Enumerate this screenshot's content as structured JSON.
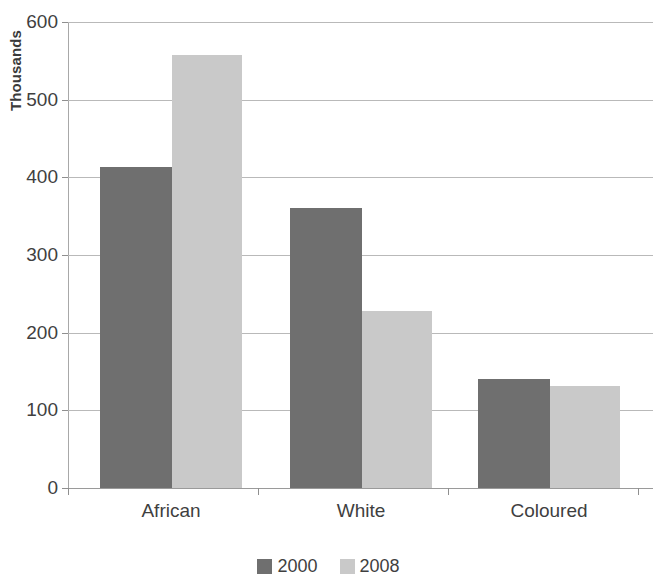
{
  "chart_data": {
    "type": "bar",
    "title": "",
    "subtitle": "",
    "xlabel": "",
    "ylabel": "Thousands",
    "categories": [
      "African",
      "White",
      "Coloured"
    ],
    "series": [
      {
        "name": "2000",
        "color": "#6f6f6f",
        "values": [
          413,
          360,
          141
        ]
      },
      {
        "name": "2008",
        "color": "#c9c9c9",
        "values": [
          557,
          228,
          131
        ]
      }
    ],
    "ylim": [
      0,
      600
    ],
    "ytick_values": [
      0,
      100,
      200,
      300,
      400,
      500,
      600
    ],
    "ytick_labels": [
      "0",
      "100",
      "200",
      "300",
      "400",
      "500",
      "600"
    ],
    "grid": true,
    "grid_axis": "y",
    "legend_position": "bottom",
    "legend_entries": [
      "2000",
      "2008"
    ],
    "annotations": []
  },
  "axis": {
    "y_title": "Thousands"
  },
  "colors": {
    "series_2000": "#6f6f6f",
    "series_2008": "#c9c9c9",
    "gridline": "#b9b9b9",
    "text": "#3f3f3f",
    "background": "#ffffff"
  }
}
